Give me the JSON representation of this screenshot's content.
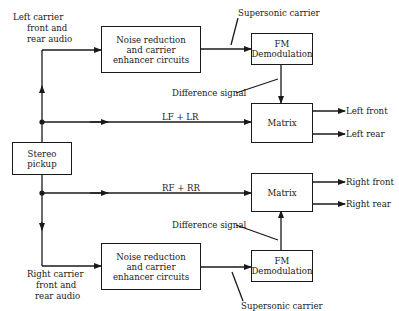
{
  "diagram": {
    "title": "",
    "type": "block-diagram",
    "colors": {
      "line": "#1a1a1a",
      "background": "#ffffff"
    },
    "blocks": {
      "stereo_pickup": "Stereo\npickup",
      "nr_top": "Noise reduction\nand carrier\nenhancer circuits",
      "nr_bottom": "Noise reduction\nand carrier\nenhancer circuits",
      "fm_top": "FM\nDemodulation",
      "fm_bottom": "FM\nDemodulation",
      "matrix_top": "Matrix",
      "matrix_bottom": "Matrix"
    },
    "labels": {
      "left_carrier_1": "Left carrier",
      "left_carrier_2": "front and",
      "left_carrier_3": "rear audio",
      "right_carrier_1": "Right carrier",
      "right_carrier_2": "front and",
      "right_carrier_3": "rear audio",
      "supersonic_top": "Supersonic carrier",
      "supersonic_bottom": "Supersonic carrier",
      "diff_top": "Difference signal",
      "diff_bottom": "Difference signal",
      "lf_lr": "LF + LR",
      "rf_rr": "RF + RR",
      "left_front": "Left front",
      "left_rear": "Left rear",
      "right_front": "Right front",
      "right_rear": "Right rear"
    },
    "edges": [
      {
        "from": "stereo_pickup",
        "to": "nr_top",
        "label": "Left carrier front and rear audio"
      },
      {
        "from": "stereo_pickup",
        "to": "matrix_top",
        "label": "LF + LR"
      },
      {
        "from": "nr_top",
        "to": "fm_top",
        "label": "Supersonic carrier"
      },
      {
        "from": "fm_top",
        "to": "matrix_top",
        "label": "Difference signal"
      },
      {
        "from": "matrix_top",
        "to": "out_left_front",
        "label": "Left front"
      },
      {
        "from": "matrix_top",
        "to": "out_left_rear",
        "label": "Left rear"
      },
      {
        "from": "stereo_pickup",
        "to": "matrix_bottom",
        "label": "RF + RR"
      },
      {
        "from": "stereo_pickup",
        "to": "nr_bottom",
        "label": "Right carrier front and rear audio"
      },
      {
        "from": "nr_bottom",
        "to": "fm_bottom",
        "label": "Supersonic carrier"
      },
      {
        "from": "fm_bottom",
        "to": "matrix_bottom",
        "label": "Difference signal"
      },
      {
        "from": "matrix_bottom",
        "to": "out_right_front",
        "label": "Right front"
      },
      {
        "from": "matrix_bottom",
        "to": "out_right_rear",
        "label": "Right rear"
      }
    ]
  }
}
